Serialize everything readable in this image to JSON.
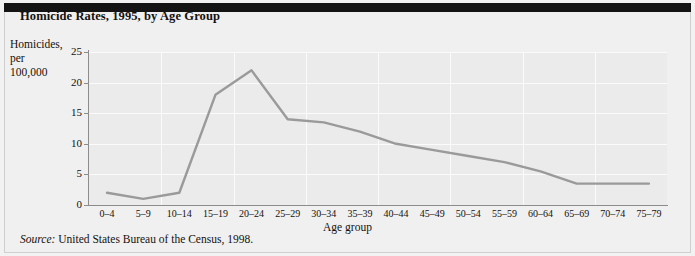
{
  "figure": {
    "title": "Homicide Rates, 1995, by Age Group",
    "source_label": "Source:",
    "source_text": "United States Bureau of the Census, 1998.",
    "background_color": "#f0f0f0",
    "plot_background_color": "#ebebeb",
    "gridline_color": "#fbfbfb",
    "axis_color": "#8c8c8c",
    "line_color": "#9a9a9a"
  },
  "chart_data": {
    "type": "line",
    "title": "Homicide Rates, 1995, by Age Group",
    "xlabel": "Age group",
    "ylabel": "Homicides,\nper\n100,000",
    "categories": [
      "0–4",
      "5–9",
      "10–14",
      "15–19",
      "20–24",
      "25–29",
      "30–34",
      "35–39",
      "40–44",
      "45–49",
      "50–54",
      "55–59",
      "60–64",
      "65–69",
      "70–74",
      "75–79"
    ],
    "values": [
      2,
      1,
      2,
      18,
      22,
      14,
      13.5,
      12,
      10,
      9,
      8,
      7,
      5.5,
      3.5,
      3.5,
      3.5
    ],
    "ylim": [
      0,
      25
    ],
    "yticks": [
      0,
      5,
      10,
      15,
      20,
      25
    ],
    "ytick_labels": [
      "0",
      "5",
      "10",
      "15",
      "20",
      "25"
    ],
    "grid": true,
    "legend": "none",
    "series_name": "Homicides per 100,000"
  }
}
